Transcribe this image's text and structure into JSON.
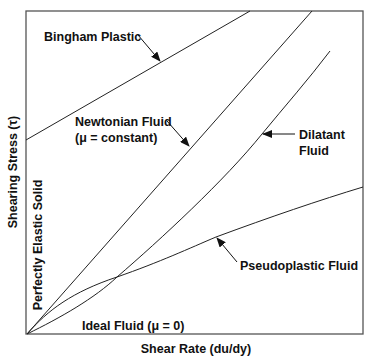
{
  "diagram": {
    "type": "rheology-shear-stress-vs-shear-rate",
    "axes": {
      "x_label": "Shear Rate (du/dy)",
      "y_label": "Shearing Stress (τ)"
    },
    "curves": [
      {
        "id": "bingham",
        "label": "Bingham Plastic",
        "shape": "straight line with positive y-intercept"
      },
      {
        "id": "newtonian",
        "label_line1": "Newtonian Fluid",
        "label_line2": "(μ = constant)",
        "shape": "straight line through origin"
      },
      {
        "id": "dilatant",
        "label_line1": "Dilatant",
        "label_line2": "Fluid",
        "shape": "concave-up curve through origin"
      },
      {
        "id": "pseudoplastic",
        "label": "Pseudoplastic Fluid",
        "shape": "concave-down curve through origin"
      },
      {
        "id": "elastic",
        "label": "Perfectly Elastic Solid",
        "shape": "vertical line along y-axis"
      },
      {
        "id": "ideal",
        "label": "Ideal Fluid (μ = 0)",
        "shape": "horizontal line along x-axis"
      }
    ],
    "colors": {
      "line": "#222222",
      "frame": "#555555",
      "text": "#111111",
      "background": "#ffffff"
    }
  }
}
